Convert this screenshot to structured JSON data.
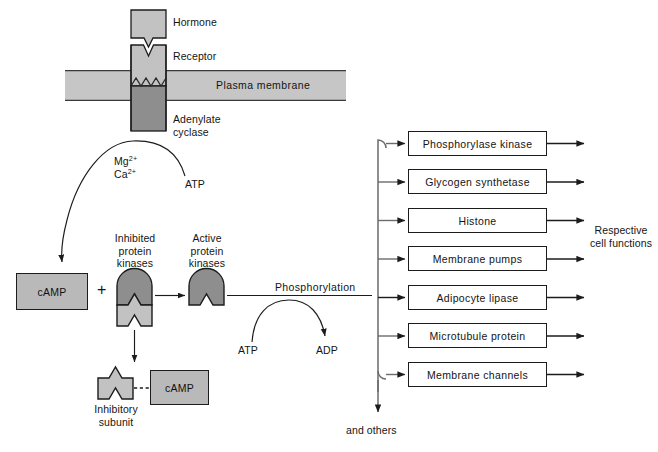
{
  "diagram": {
    "colors": {
      "membrane_fill": "#c6c6c6",
      "receptor_fill": "#c2c2c2",
      "cyclase_fill": "#8e8e8e",
      "hormone_fill": "#c2c2c2",
      "kinase_active_fill": "#8e8e8e",
      "kinase_inhibitory_fill": "#c2c2c2",
      "camp_fill": "#b9b9b9",
      "stroke": "#1c1c1c",
      "box_fill": "#ffffff"
    }
  },
  "labels": {
    "hormone": "Hormone",
    "receptor": "Receptor",
    "plasma_membrane": "Plasma membrane",
    "adenylate_cyclase_line1": "Adenylate",
    "adenylate_cyclase_line2": "cyclase",
    "mg_ion": "Mg",
    "mg_charge": "2+",
    "ca_ion": "Ca",
    "ca_charge": "2+",
    "atp_top": "ATP",
    "camp_left": "cAMP",
    "plus": "+",
    "inhibited_kinases": "Inhibited\nprotein\nkinases",
    "active_kinases": "Active\nprotein\nkinases",
    "phosphorylation": "Phosphorylation",
    "atp_bottom": "ATP",
    "adp": "ADP",
    "camp_bound": "cAMP",
    "inhibitory_subunit": "Inhibitory\nsubunit",
    "respective_cell_functions": "Respective\ncell functions",
    "and_others": "and others"
  },
  "effectors": [
    {
      "label": "Phosphorylase  kinase"
    },
    {
      "label": "Glycogen  synthetase"
    },
    {
      "label": "Histone"
    },
    {
      "label": "Membrane pumps"
    },
    {
      "label": "Adipocyte  lipase"
    },
    {
      "label": "Microtubule protein"
    },
    {
      "label": "Membrane channels"
    }
  ]
}
